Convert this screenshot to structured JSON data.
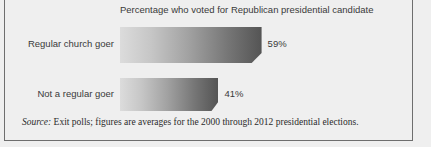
{
  "chart_data": {
    "type": "bar",
    "orientation": "horizontal",
    "title": "Percentage who voted for Republican presidential candidate",
    "xlabel": "",
    "ylabel": "",
    "xlim": [
      0,
      100
    ],
    "grid": false,
    "legend": "none",
    "categories": [
      "Regular church goer",
      "Not a regular goer"
    ],
    "values": [
      59,
      41
    ],
    "value_labels": [
      "59%",
      "41%"
    ],
    "value_unit": "%",
    "bar_style": {
      "gradient_start": "#dcdcdc",
      "gradient_end": "#545454",
      "beveled_corner": true
    }
  },
  "figure": {
    "background_color": "#efefef",
    "border_color": "#6e6e6e"
  },
  "source": {
    "label": "Source:",
    "text": " Exit polls; figures are averages for the 2000 through 2012 presidential elections."
  }
}
